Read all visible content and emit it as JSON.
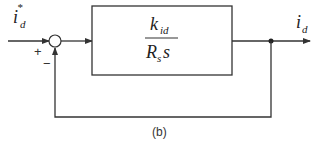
{
  "diagram": {
    "type": "closed-loop block diagram",
    "input": {
      "symbol": "i",
      "subscript": "d",
      "superscript": "*"
    },
    "summing_junction": {
      "plus_sign": "+",
      "minus_sign": "−"
    },
    "block": {
      "numerator": {
        "symbol": "k",
        "subscript": "id"
      },
      "denominator": {
        "symbol": "R",
        "subscript": "s",
        "suffix": "s"
      }
    },
    "output": {
      "symbol": "i",
      "subscript": "d"
    },
    "feedback": "unity",
    "caption": "(b)",
    "colors": {
      "line": "#333333",
      "background": "#ffffff"
    }
  }
}
